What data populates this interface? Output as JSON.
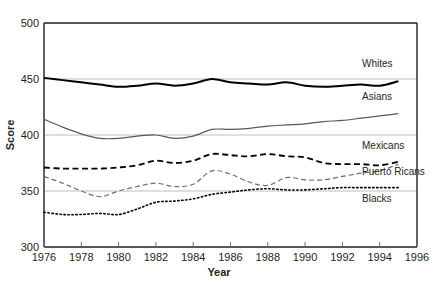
{
  "chart_data": {
    "type": "line",
    "title": "",
    "xlabel": "Year",
    "ylabel": "Score",
    "xlim": [
      1976,
      1996
    ],
    "ylim": [
      300,
      500
    ],
    "xticks": [
      1976,
      1978,
      1980,
      1982,
      1984,
      1986,
      1988,
      1990,
      1992,
      1994,
      1996
    ],
    "yticks": [
      300,
      350,
      400,
      450,
      500
    ],
    "grid": "horizontal-gridlines-at-350-400-450",
    "legend_position": "right-inline-labels",
    "x": [
      1976,
      1977,
      1978,
      1979,
      1980,
      1981,
      1982,
      1983,
      1984,
      1985,
      1986,
      1987,
      1988,
      1989,
      1990,
      1991,
      1992,
      1993,
      1994,
      1995
    ],
    "series": [
      {
        "name": "Whites",
        "style": "solid-thick-black",
        "color": "#000000",
        "values": [
          451,
          449,
          447,
          445,
          443,
          444,
          446,
          444,
          446,
          450,
          447,
          446,
          445,
          447,
          444,
          443,
          444,
          445,
          444,
          448
        ]
      },
      {
        "name": "Asians",
        "style": "solid-thin-gray",
        "color": "#58595b",
        "values": [
          414,
          407,
          401,
          397,
          397,
          399,
          400,
          397,
          399,
          405,
          405,
          406,
          408,
          409,
          410,
          412,
          413,
          415,
          417,
          419
        ]
      },
      {
        "name": "Mexicans",
        "style": "dashed-black",
        "color": "#000000",
        "values": [
          371,
          370,
          370,
          370,
          371,
          373,
          377,
          375,
          377,
          383,
          382,
          381,
          383,
          381,
          380,
          375,
          374,
          374,
          373,
          376
        ]
      },
      {
        "name": "Puerto Ricans",
        "style": "dashed-thin-gray",
        "color": "#6d6e71",
        "values": [
          363,
          357,
          350,
          345,
          350,
          354,
          357,
          354,
          356,
          368,
          365,
          358,
          355,
          362,
          360,
          360,
          363,
          366,
          368,
          374
        ]
      },
      {
        "name": "Blacks",
        "style": "dotted-black",
        "color": "#000000",
        "values": [
          331,
          329,
          329,
          330,
          329,
          334,
          340,
          341,
          343,
          347,
          349,
          351,
          352,
          351,
          351,
          352,
          353,
          353,
          353,
          353
        ]
      }
    ]
  },
  "axes": {
    "y_labels": [
      "500",
      "450",
      "400",
      "350",
      "300"
    ],
    "x_labels": [
      "1976",
      "1978",
      "1980",
      "1982",
      "1984",
      "1986",
      "1988",
      "1990",
      "1992",
      "1994",
      "1996"
    ],
    "x_title": "Year",
    "y_title": "Score"
  },
  "series_labels": [
    {
      "name": "Whites",
      "text": "Whites"
    },
    {
      "name": "Asians",
      "text": "Asians"
    },
    {
      "name": "Mexicans",
      "text": "Mexicans"
    },
    {
      "name": "Puerto Ricans",
      "text": "Puerto Ricans"
    },
    {
      "name": "Blacks",
      "text": "Blacks"
    }
  ],
  "colors": {
    "frame": "#231f20",
    "gridline": "#bcbec0",
    "text": "#231f20",
    "gray_series": "#58595b",
    "gray_series_light": "#6d6e71"
  }
}
